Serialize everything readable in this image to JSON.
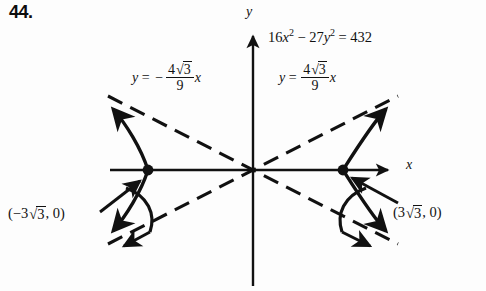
{
  "problem": {
    "number": "44."
  },
  "axes": {
    "x_label": "x",
    "y_label": "y",
    "origin_x": 253,
    "origin_y": 170,
    "x_axis_left_end": 110,
    "x_axis_right_end": 391,
    "y_axis_top_end": 34,
    "y_axis_bottom_end": 286
  },
  "equation": {
    "coef_x": "16",
    "var_x": "x",
    "exp_x": "2",
    "minus": "−",
    "coef_y": "27",
    "var_y": "y",
    "exp_y": "2",
    "equals": "=",
    "rhs": "432",
    "plain": "16x² − 27y² = 432"
  },
  "asymptotes": {
    "left": {
      "y": "y",
      "equals": "=",
      "sign": "−",
      "numer_coef": "4",
      "numer_radicand": "3",
      "denom": "9",
      "var": "x",
      "plain": "y = −(4√3/9)x",
      "slope_value": -0.7698
    },
    "right": {
      "y": "y",
      "equals": "=",
      "sign": "",
      "numer_coef": "4",
      "numer_radicand": "3",
      "denom": "9",
      "var": "x",
      "plain": "y = (4√3/9)x",
      "slope_value": 0.7698
    }
  },
  "vertices": {
    "left": {
      "open": "(",
      "sign": "−",
      "coef": "3",
      "radicand": "3",
      "comma": ",",
      "y_value": "0",
      "close": ")",
      "plain": "(−3√3, 0)",
      "dot_x": 148,
      "dot_y": 170
    },
    "right": {
      "open": "(",
      "sign": "",
      "coef": "3",
      "radicand": "3",
      "comma": ",",
      "y_value": "0",
      "close": ")",
      "plain": "(3√3, 0)",
      "dot_x": 343,
      "dot_y": 170
    }
  },
  "colors": {
    "ink": "#111111",
    "background": "#fdfdfd"
  }
}
